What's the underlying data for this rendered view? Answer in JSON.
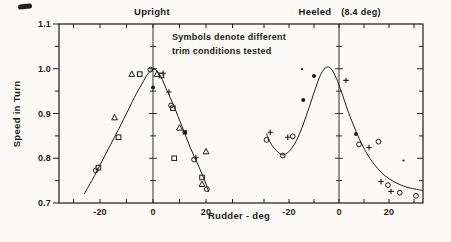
{
  "style": {
    "ink": "#1c1c1b",
    "paper": "#fbfaf6"
  },
  "labels": {
    "upright_title": "Upright",
    "heeled_title": "Heeled",
    "heeled_condition": "(8.4 deg)",
    "annotation_line1": "Symbols denote different",
    "annotation_line2": "trim conditions tested",
    "y_axis": "Speed in Turn",
    "x_axis": "Rudder - deg"
  },
  "axes": {
    "ylim": [
      0.7,
      1.1
    ],
    "yticks_major": [
      1.1,
      1.0,
      0.9,
      0.8,
      0.7
    ],
    "ytick_labels": [
      "1.1",
      "1.0",
      "0.9",
      "0.8",
      "0.7"
    ],
    "ytick_minor_step": 0.05,
    "xticks_all": [
      -30,
      -20,
      -10,
      0,
      10,
      20,
      30
    ],
    "xticks_labeled": [
      -20,
      0,
      20
    ],
    "xtick_labels": [
      "-20",
      "0",
      "20"
    ],
    "grid": false
  },
  "chart_data": [
    {
      "type": "scatter",
      "title": "Upright",
      "xlabel": "Rudder - deg",
      "ylabel": "Speed in Turn",
      "xlim": [
        -35.5,
        39
      ],
      "ylim": [
        0.7,
        1.1
      ],
      "curve": [
        [
          -26,
          0.72
        ],
        [
          -22,
          0.762
        ],
        [
          -18,
          0.808
        ],
        [
          -14,
          0.853
        ],
        [
          -10,
          0.9
        ],
        [
          -7,
          0.936
        ],
        [
          -4,
          0.968
        ],
        [
          -2,
          0.988
        ],
        [
          0,
          0.999
        ],
        [
          1.5,
          0.995
        ],
        [
          3,
          0.982
        ],
        [
          5,
          0.955
        ],
        [
          8,
          0.915
        ],
        [
          11,
          0.87
        ],
        [
          14,
          0.825
        ],
        [
          17,
          0.785
        ],
        [
          19.5,
          0.75
        ],
        [
          21,
          0.725
        ]
      ],
      "series": [
        {
          "name": "trim-condition-triangle",
          "marker": "triangle-open",
          "points": [
            [
              -14.5,
              0.891
            ],
            [
              -8,
              0.988
            ],
            [
              1.5,
              0.988
            ],
            [
              10,
              0.868
            ],
            [
              20,
              0.815
            ],
            [
              18.5,
              0.742
            ]
          ]
        },
        {
          "name": "trim-condition-square",
          "marker": "square-open",
          "points": [
            [
              -20.6,
              0.779
            ],
            [
              -13,
              0.847
            ],
            [
              -5,
              0.988
            ],
            [
              3.2,
              0.985
            ],
            [
              7.5,
              0.912
            ],
            [
              8,
              0.8
            ],
            [
              18.5,
              0.757
            ]
          ]
        },
        {
          "name": "trim-condition-circle",
          "marker": "circle-open",
          "points": [
            [
              -21.6,
              0.773
            ],
            [
              -1,
              0.998
            ],
            [
              6.8,
              0.918
            ],
            [
              15.5,
              0.797
            ],
            [
              20.3,
              0.731
            ]
          ]
        },
        {
          "name": "trim-condition-plus",
          "marker": "plus",
          "points": [
            [
              3.8,
              0.99
            ],
            [
              6,
              0.948
            ],
            [
              16.2,
              0.801
            ]
          ]
        },
        {
          "name": "trim-condition-filled-circle",
          "marker": "circle-filled",
          "points": [
            [
              0,
              0.958
            ]
          ]
        },
        {
          "name": "trim-condition-filled-square",
          "marker": "square-filled",
          "points": [
            [
              12,
              0.858
            ]
          ]
        }
      ]
    },
    {
      "type": "scatter",
      "title": "Heeled (8.4 deg)",
      "xlabel": "Rudder - deg",
      "ylabel": "Speed in Turn",
      "xlim": [
        -33.5,
        33.6
      ],
      "ylim": [
        0.7,
        1.1
      ],
      "curve": [
        [
          -29,
          0.855
        ],
        [
          -27,
          0.83
        ],
        [
          -24,
          0.812
        ],
        [
          -22,
          0.808
        ],
        [
          -19.5,
          0.818
        ],
        [
          -17,
          0.84
        ],
        [
          -14.5,
          0.873
        ],
        [
          -12,
          0.913
        ],
        [
          -9.5,
          0.955
        ],
        [
          -7.5,
          0.985
        ],
        [
          -6,
          0.999
        ],
        [
          -4.5,
          1.004
        ],
        [
          -3,
          0.999
        ],
        [
          -1,
          0.978
        ],
        [
          1,
          0.948
        ],
        [
          3,
          0.915
        ],
        [
          5,
          0.885
        ],
        [
          8,
          0.845
        ],
        [
          11,
          0.812
        ],
        [
          14,
          0.787
        ],
        [
          17,
          0.768
        ],
        [
          20,
          0.754
        ],
        [
          24,
          0.742
        ],
        [
          28,
          0.734
        ],
        [
          33.5,
          0.728
        ]
      ],
      "series": [
        {
          "name": "trim-condition-circle",
          "marker": "circle-open",
          "points": [
            [
              -29,
              0.841
            ],
            [
              -22.5,
              0.806
            ],
            [
              -18.5,
              0.849
            ],
            [
              8,
              0.831
            ],
            [
              15.8,
              0.837
            ],
            [
              19.6,
              0.74
            ],
            [
              24.3,
              0.723
            ],
            [
              30.8,
              0.716
            ]
          ]
        },
        {
          "name": "trim-condition-plus",
          "marker": "plus",
          "points": [
            [
              -27.5,
              0.858
            ],
            [
              -20.5,
              0.847
            ],
            [
              2.8,
              0.974
            ],
            [
              12,
              0.824
            ],
            [
              16.8,
              0.748
            ],
            [
              20.8,
              0.726
            ]
          ]
        },
        {
          "name": "trim-condition-filled-circle",
          "marker": "circle-filled",
          "points": [
            [
              -14.3,
              0.93
            ],
            [
              -10,
              0.984
            ],
            [
              6.8,
              0.854
            ]
          ]
        },
        {
          "name": "trim-condition-dot",
          "marker": "dot",
          "points": [
            [
              -14.8,
              0.999
            ],
            [
              25.8,
              0.795
            ]
          ]
        }
      ]
    }
  ]
}
